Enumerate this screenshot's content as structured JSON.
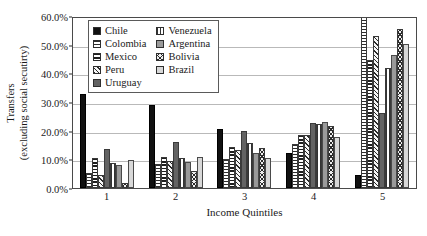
{
  "chart_data": {
    "type": "bar",
    "title": "",
    "xlabel": "Income Quintiles",
    "ylabel_line1": "Transfers",
    "ylabel_line2": "(excluding social secutirty)",
    "categories": [
      "1",
      "2",
      "3",
      "4",
      "5"
    ],
    "ylim": [
      0,
      60
    ],
    "yticks": [
      "0.0%",
      "10.0%",
      "20.0%",
      "30.0%",
      "40.0%",
      "50.0%",
      "60.0%"
    ],
    "ytick_values": [
      0,
      10,
      20,
      30,
      40,
      50,
      60
    ],
    "grid": true,
    "legend_position": "top-center-inside",
    "series": [
      {
        "name": "Chile",
        "pattern": "solid-black",
        "values": [
          32.7,
          28.9,
          20.6,
          12.1,
          4.7
        ]
      },
      {
        "name": "Colombia",
        "pattern": "horizontal-lines",
        "values": [
          5.3,
          8.5,
          10.2,
          15.4,
          60.0
        ]
      },
      {
        "name": "Mexico",
        "pattern": "dotted-grid",
        "values": [
          10.4,
          10.9,
          14.3,
          18.4,
          44.5
        ]
      },
      {
        "name": "Peru",
        "pattern": "diagonal-hatch",
        "values": [
          4.7,
          9.4,
          13.4,
          18.5,
          53.0
        ]
      },
      {
        "name": "Uruguay",
        "pattern": "solid-dark-gray",
        "values": [
          13.6,
          16.1,
          20.0,
          22.6,
          26.3
        ]
      },
      {
        "name": "Venezuela",
        "pattern": "vertical-lines",
        "values": [
          8.6,
          10.6,
          15.6,
          22.3,
          41.9
        ]
      },
      {
        "name": "Argentina",
        "pattern": "solid-mid-gray",
        "values": [
          8.0,
          9.2,
          12.2,
          23.0,
          46.4
        ]
      },
      {
        "name": "Bolivia",
        "pattern": "cross-hatch",
        "values": [
          1.6,
          6.1,
          13.9,
          21.5,
          55.5
        ]
      },
      {
        "name": "Brazil",
        "pattern": "solid-light-gray",
        "values": [
          9.7,
          10.7,
          10.5,
          17.8,
          50.1
        ]
      }
    ]
  },
  "legend": {
    "column_left": [
      "Chile",
      "Colombia",
      "Mexico",
      "Peru",
      "Uruguay"
    ],
    "column_right": [
      "Venezuela",
      "Argentina",
      "Bolivia",
      "Brazil"
    ]
  }
}
